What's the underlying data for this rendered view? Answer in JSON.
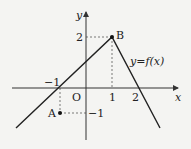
{
  "axes": {
    "x_label": "x",
    "y_label": "y",
    "origin_label": "O"
  },
  "ticks": {
    "x_neg1": "−1",
    "x_1": "1",
    "x_2": "2",
    "y_2": "2",
    "y_neg1": "−1"
  },
  "points": {
    "A": "A",
    "B": "B"
  },
  "function_label": "y=f(x)",
  "colors": {
    "line": "#222222",
    "background": "#f4f4f2"
  }
}
